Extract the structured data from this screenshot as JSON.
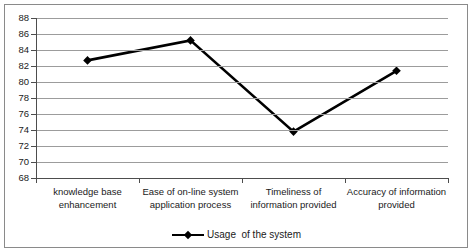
{
  "chart_data": {
    "type": "line",
    "title": "",
    "subtitle": "",
    "xlabel": "",
    "ylabel": "",
    "categories": [
      "knowledge base enhancement",
      "Ease of on-line system application process",
      "Timeliness of information provided",
      "Accuracy of information provided"
    ],
    "series": [
      {
        "name": "Usage  of the system",
        "values": [
          82.7,
          85.2,
          73.8,
          81.4
        ]
      }
    ],
    "ylim": [
      68,
      88
    ],
    "ytick_step": 2,
    "yticks": [
      88,
      86,
      84,
      82,
      80,
      78,
      76,
      74,
      72,
      70,
      68
    ],
    "grid": true,
    "grid_axis": "y",
    "legend_position": "bottom",
    "marker": "diamond",
    "line_color": "#000000",
    "grid_color": "#9c9c9c",
    "axis_color": "#4d4d4d",
    "background_color": "#ffffff",
    "border_color": "#8a8a8a"
  },
  "axis": {
    "y_tick_labels": [
      "88",
      "86",
      "84",
      "82",
      "80",
      "78",
      "76",
      "74",
      "72",
      "70",
      "68"
    ],
    "x_category_lines": [
      [
        "knowledge base",
        "enhancement"
      ],
      [
        "Ease of on-line system",
        "application process"
      ],
      [
        "Timeliness of",
        "information provided"
      ],
      [
        "Accuracy of information",
        "provided"
      ]
    ]
  },
  "legend": {
    "entries": [
      {
        "label": "Usage  of the system",
        "marker": "diamond",
        "color": "#000000"
      }
    ]
  }
}
